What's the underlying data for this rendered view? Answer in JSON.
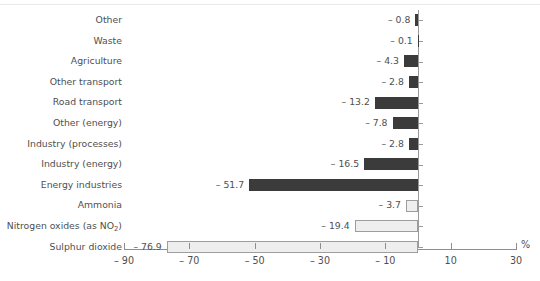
{
  "chart_data": {
    "type": "bar",
    "orientation": "horizontal",
    "title": "",
    "subtitle": "",
    "xlabel": "%",
    "ylabel": "",
    "xlim": [
      -90,
      30
    ],
    "xticks": [
      -90,
      -70,
      -50,
      -30,
      -10,
      10,
      30
    ],
    "xticklabels": [
      "– 90",
      "– 70",
      "– 50",
      "– 30",
      "– 10",
      "10",
      "30"
    ],
    "grid": false,
    "legend": false,
    "legend_position": "none",
    "series_colors": {
      "dark": "#3b3b3b",
      "light": "#eeeeee",
      "light_border": "#9d9d9d",
      "axis": "#8e8e8e",
      "text": "#4f4f4f",
      "top_rule": "#e9e9e9"
    },
    "categories": [
      "Other",
      "Waste",
      "Agriculture",
      "Other transport",
      "Road transport",
      "Other (energy)",
      "Industry (processes)",
      "Industry (energy)",
      "Energy industries",
      "Ammonia",
      "Nitrogen oxides (as NO2)",
      "Sulphur dioxide"
    ],
    "values": [
      -0.8,
      -0.1,
      -4.3,
      -2.8,
      -13.2,
      -7.8,
      -2.8,
      -16.5,
      -51.7,
      -3.7,
      -19.4,
      -76.9
    ],
    "value_labels": [
      "– 0.8",
      "– 0.1",
      "– 4.3",
      "– 2.8",
      "– 13.2",
      "– 7.8",
      "– 2.8",
      "– 16.5",
      "– 51.7",
      "– 3.7",
      "– 19.4",
      "– 76.9"
    ],
    "styles": [
      "dark",
      "dark",
      "dark",
      "dark",
      "dark",
      "dark",
      "dark",
      "dark",
      "dark",
      "light",
      "light",
      "light"
    ]
  },
  "rows": [
    {
      "label": "Other",
      "label_html": "Other",
      "value_label": "– 0.8",
      "value": -0.8,
      "style": "dark"
    },
    {
      "label": "Waste",
      "label_html": "Waste",
      "value_label": "– 0.1",
      "value": -0.1,
      "style": "dark"
    },
    {
      "label": "Agriculture",
      "label_html": "Agriculture",
      "value_label": "– 4.3",
      "value": -4.3,
      "style": "dark"
    },
    {
      "label": "Other transport",
      "label_html": "Other transport",
      "value_label": "– 2.8",
      "value": -2.8,
      "style": "dark"
    },
    {
      "label": "Road transport",
      "label_html": "Road transport",
      "value_label": "– 13.2",
      "value": -13.2,
      "style": "dark"
    },
    {
      "label": "Other (energy)",
      "label_html": "Other (energy)",
      "value_label": "– 7.8",
      "value": -7.8,
      "style": "dark"
    },
    {
      "label": "Industry (processes)",
      "label_html": "Industry (processes)",
      "value_label": "– 2.8",
      "value": -2.8,
      "style": "dark"
    },
    {
      "label": "Industry (energy)",
      "label_html": "Industry (energy)",
      "value_label": "– 16.5",
      "value": -16.5,
      "style": "dark"
    },
    {
      "label": "Energy industries",
      "label_html": "Energy industries",
      "value_label": "– 51.7",
      "value": -51.7,
      "style": "dark"
    },
    {
      "label": "Ammonia",
      "label_html": "Ammonia",
      "value_label": "– 3.7",
      "value": -3.7,
      "style": "light"
    },
    {
      "label": "Nitrogen oxides (as NO2)",
      "label_html": "Nitrogen oxides (as NO<sub>2</sub>)",
      "value_label": "– 19.4",
      "value": -19.4,
      "style": "light"
    },
    {
      "label": "Sulphur dioxide",
      "label_html": "Sulphur dioxide",
      "value_label": "– 76.9",
      "value": -76.9,
      "style": "light"
    }
  ],
  "axis": {
    "unit": "%",
    "ticks": [
      {
        "value": -90,
        "label": "– 90"
      },
      {
        "value": -70,
        "label": "– 70"
      },
      {
        "value": -50,
        "label": "– 50"
      },
      {
        "value": -30,
        "label": "– 30"
      },
      {
        "value": -10,
        "label": "– 10"
      },
      {
        "value": 10,
        "label": "10"
      },
      {
        "value": 30,
        "label": "30"
      }
    ]
  }
}
